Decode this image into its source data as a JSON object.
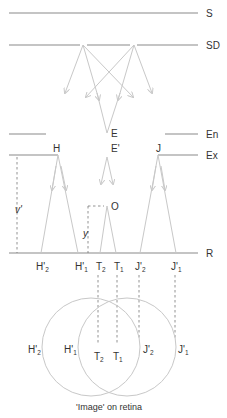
{
  "levels": {
    "S": "S",
    "SD": "SD",
    "En": "En",
    "Ex": "Ex",
    "R": "R"
  },
  "points": {
    "E": "E",
    "E_prime": "E'",
    "H": "H",
    "J": "J",
    "O": "O",
    "y": "y",
    "v_prime": "v'"
  },
  "projection_labels": {
    "H2": {
      "base": "H'",
      "sub": "2"
    },
    "H1": {
      "base": "H'",
      "sub": "1"
    },
    "T2": {
      "base": "T",
      "sub": "2"
    },
    "T1": {
      "base": "T",
      "sub": "1"
    },
    "J2": {
      "base": "J'",
      "sub": "2"
    },
    "J1": {
      "base": "J'",
      "sub": "1"
    }
  },
  "retina_labels": {
    "H2": {
      "base": "H'",
      "sub": "2"
    },
    "H1": {
      "base": "H'",
      "sub": "1"
    },
    "T2": {
      "base": "T",
      "sub": "2"
    },
    "T1": {
      "base": "T",
      "sub": "1"
    },
    "J2": {
      "base": "J'",
      "sub": "2"
    },
    "J1": {
      "base": "J'",
      "sub": "1"
    }
  },
  "caption": "'Image' on retina",
  "colors": {
    "line": "#8a8a8a",
    "ray": "#c8c8c8",
    "text": "#333333"
  }
}
